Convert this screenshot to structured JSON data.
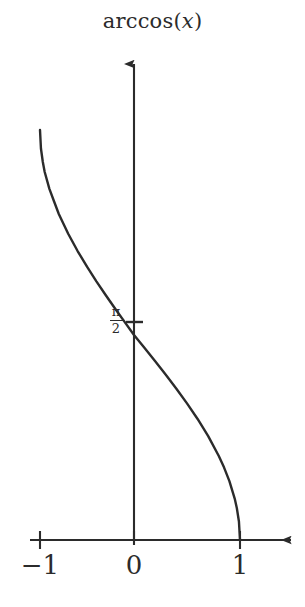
{
  "figure": {
    "width": 305,
    "height": 607,
    "background": "#ffffff",
    "ink_color": "#2b2b2b"
  },
  "title": {
    "full_text": "arccos(x)",
    "prefix": "arccos(",
    "variable": "x",
    "suffix": ")"
  },
  "axes": {
    "x_axis": {
      "name": "x-axis",
      "arrow": "right",
      "tick_labels": [
        "−1",
        "0",
        "1"
      ],
      "tick_values": [
        -1,
        0,
        1
      ]
    },
    "y_axis": {
      "name": "y-axis",
      "arrow": "up",
      "tick_labels": [
        "π/2"
      ],
      "tick_values": [
        1.5707963
      ]
    }
  },
  "labels": {
    "x_neg1": "−1",
    "x_zero": "0",
    "x_one": "1",
    "y_pi_over_2_numerator": "π",
    "y_pi_over_2_denominator": "2"
  },
  "chart_data": {
    "type": "line",
    "title": "arccos(x)",
    "xlabel": "",
    "ylabel": "",
    "xlim": [
      -1.05,
      1.6
    ],
    "ylim": [
      -0.1,
      3.6
    ],
    "grid": false,
    "legend": null,
    "xticks": [
      -1,
      0,
      1
    ],
    "xticklabels": [
      "−1",
      "0",
      "1"
    ],
    "yticks": [
      1.5707963
    ],
    "yticklabels": [
      "π/2"
    ],
    "series": [
      {
        "name": "arccos(x)",
        "color": "#2b2b2b",
        "x": [
          -1.0,
          -0.99,
          -0.97,
          -0.95,
          -0.9,
          -0.85,
          -0.8,
          -0.7,
          -0.6,
          -0.5,
          -0.4,
          -0.3,
          -0.2,
          -0.1,
          0.0,
          0.1,
          0.2,
          0.3,
          0.4,
          0.5,
          0.6,
          0.7,
          0.8,
          0.85,
          0.9,
          0.95,
          0.97,
          0.99,
          1.0
        ],
        "y": [
          3.1416,
          2.9999,
          2.8964,
          2.8198,
          2.6906,
          2.5936,
          2.4981,
          2.3462,
          2.2143,
          2.0944,
          1.9823,
          1.8755,
          1.7722,
          1.671,
          1.5708,
          1.4706,
          1.3694,
          1.2661,
          1.1593,
          1.0472,
          0.9273,
          0.7954,
          0.6435,
          0.5548,
          0.451,
          0.3176,
          0.2453,
          0.1415,
          0.0
        ]
      }
    ],
    "annotations": [
      {
        "text": "π/2",
        "x": 0,
        "y": 1.5707963,
        "note": "y-axis intercept marked with tick"
      }
    ],
    "domain": [
      -1,
      1
    ],
    "range": [
      0,
      3.14159
    ]
  }
}
